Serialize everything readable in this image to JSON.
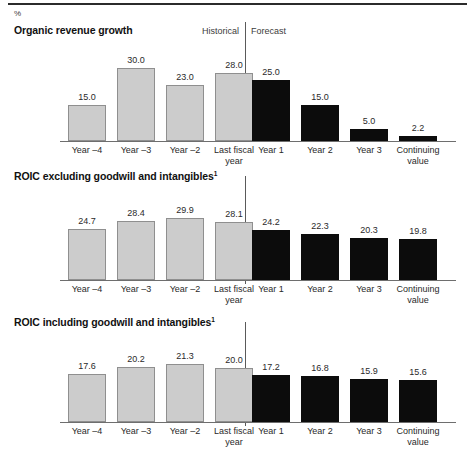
{
  "unit_label": "%",
  "band": {
    "historical": "Historical",
    "forecast": "Forecast"
  },
  "panels": [
    {
      "title": "Organic revenue growth",
      "footnote": ""
    },
    {
      "title": "ROIC excluding goodwill and intangibles",
      "footnote": "1"
    },
    {
      "title": "ROIC including goodwill and intangibles",
      "footnote": "1"
    }
  ],
  "categories": [
    "Year –4",
    "Year –3",
    "Year –2",
    "Last fiscal\nyear",
    "Year 1",
    "Year 2",
    "Year 3",
    "Continuing\nvalue"
  ],
  "colors": {
    "historical_fill": "#cccccc",
    "historical_border": "#8f8f8f",
    "forecast_fill": "#0c0c0c",
    "axis": "#6e6e6e",
    "rule": "#2b2b2b"
  },
  "chart_data": [
    {
      "type": "bar",
      "title": "Organic revenue growth",
      "xlabel": "",
      "ylabel": "%",
      "ylim": [
        0,
        30
      ],
      "grid": false,
      "legend": [
        "Historical",
        "Forecast"
      ],
      "legend_position": "top",
      "categories": [
        "Year –4",
        "Year –3",
        "Year –2",
        "Last fiscal year",
        "Year 1",
        "Year 2",
        "Year 3",
        "Continuing value"
      ],
      "values": [
        15.0,
        30.0,
        23.0,
        28.0,
        25.0,
        15.0,
        5.0,
        2.2
      ],
      "labels": [
        "15.0",
        "30.0",
        "23.0",
        "28.0",
        "25.0",
        "15.0",
        "5.0",
        "2.2"
      ],
      "groups": [
        "historical",
        "historical",
        "historical",
        "historical",
        "forecast",
        "forecast",
        "forecast",
        "forecast"
      ]
    },
    {
      "type": "bar",
      "title": "ROIC excluding goodwill and intangibles",
      "title_footnote": "1",
      "xlabel": "",
      "ylabel": "%",
      "ylim": [
        0,
        29.9
      ],
      "grid": false,
      "legend": [
        "Historical",
        "Forecast"
      ],
      "legend_position": "top",
      "categories": [
        "Year –4",
        "Year –3",
        "Year –2",
        "Last fiscal year",
        "Year 1",
        "Year 2",
        "Year 3",
        "Continuing value"
      ],
      "values": [
        24.7,
        28.4,
        29.9,
        28.1,
        24.2,
        22.3,
        20.3,
        19.8
      ],
      "labels": [
        "24.7",
        "28.4",
        "29.9",
        "28.1",
        "24.2",
        "22.3",
        "20.3",
        "19.8"
      ],
      "groups": [
        "historical",
        "historical",
        "historical",
        "historical",
        "forecast",
        "forecast",
        "forecast",
        "forecast"
      ]
    },
    {
      "type": "bar",
      "title": "ROIC including goodwill and intangibles",
      "title_footnote": "1",
      "xlabel": "",
      "ylabel": "%",
      "ylim": [
        0,
        21.3
      ],
      "grid": false,
      "legend": [
        "Historical",
        "Forecast"
      ],
      "legend_position": "top",
      "categories": [
        "Year –4",
        "Year –3",
        "Year –2",
        "Last fiscal year",
        "Year 1",
        "Year 2",
        "Year 3",
        "Continuing value"
      ],
      "values": [
        17.6,
        20.2,
        21.3,
        20.0,
        17.2,
        16.8,
        15.9,
        15.6
      ],
      "labels": [
        "17.6",
        "20.2",
        "21.3",
        "20.0",
        "17.2",
        "16.8",
        "15.9",
        "15.6"
      ],
      "groups": [
        "historical",
        "historical",
        "historical",
        "historical",
        "forecast",
        "forecast",
        "forecast",
        "forecast"
      ]
    }
  ]
}
